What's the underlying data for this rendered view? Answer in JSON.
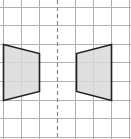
{
  "diagram": {
    "type": "reflection-grid",
    "grid": {
      "columns": 7,
      "rows": 7,
      "cell_size": 18,
      "line_color": "#b0b0b0",
      "background": "#ffffff"
    },
    "mirror_line": {
      "orientation": "vertical",
      "style": "dashed",
      "color": "#888888"
    },
    "shapes": [
      {
        "name": "left-trapezoid",
        "fill": "#d9d9d9",
        "stroke": "#222222",
        "points": [
          [
            3,
            44
          ],
          [
            39,
            53
          ],
          [
            39,
            91
          ],
          [
            3,
            100
          ]
        ]
      },
      {
        "name": "right-trapezoid",
        "fill": "#d9d9d9",
        "stroke": "#222222",
        "points": [
          [
            112,
            44
          ],
          [
            76,
            53
          ],
          [
            76,
            91
          ],
          [
            112,
            100
          ]
        ]
      }
    ]
  }
}
